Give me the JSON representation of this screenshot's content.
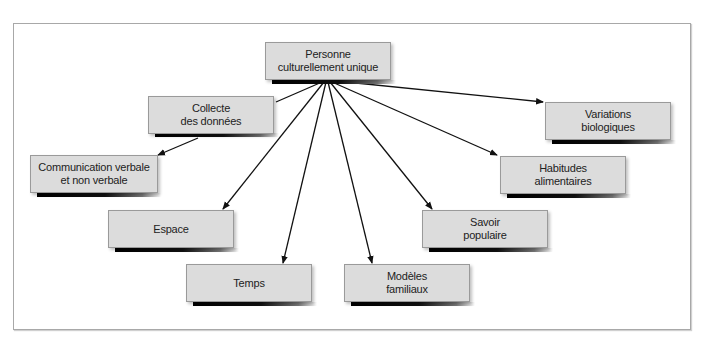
{
  "diagram": {
    "type": "concept-map",
    "root": {
      "id": "root",
      "label": "Personne\nculturellement unique"
    },
    "nodes": [
      {
        "id": "collecte",
        "label": "Collecte\ndes données"
      },
      {
        "id": "communication",
        "label": "Communication verbale\net non verbale"
      },
      {
        "id": "espace",
        "label": "Espace"
      },
      {
        "id": "temps",
        "label": "Temps"
      },
      {
        "id": "modeles",
        "label": "Modèles\nfamiliaux"
      },
      {
        "id": "savoir",
        "label": "Savoir\npopulaire"
      },
      {
        "id": "habitudes",
        "label": "Habitudes\nalimentaires"
      },
      {
        "id": "variations",
        "label": "Variations\nbiologiques"
      }
    ],
    "edges": [
      {
        "from": "root",
        "to": "collecte"
      },
      {
        "from": "collecte",
        "to": "communication"
      },
      {
        "from": "root",
        "to": "espace"
      },
      {
        "from": "root",
        "to": "temps"
      },
      {
        "from": "root",
        "to": "modeles"
      },
      {
        "from": "root",
        "to": "savoir"
      },
      {
        "from": "root",
        "to": "habitudes"
      },
      {
        "from": "root",
        "to": "variations"
      }
    ],
    "colors": {
      "node_fill": "#dcdcdc",
      "node_border": "#9a9a9a",
      "line": "#111111",
      "frame_border": "#a8a8a8"
    }
  }
}
